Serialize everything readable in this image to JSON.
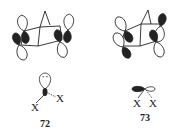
{
  "figure": {
    "left": {
      "compound_label": "72",
      "substituent_1": "X",
      "substituent_2": "X",
      "lone_pair": "··"
    },
    "right": {
      "compound_label": "73",
      "substituent_1": "X",
      "substituent_2": "X"
    }
  },
  "colors": {
    "ink": "#222222",
    "background": "#ffffff"
  }
}
